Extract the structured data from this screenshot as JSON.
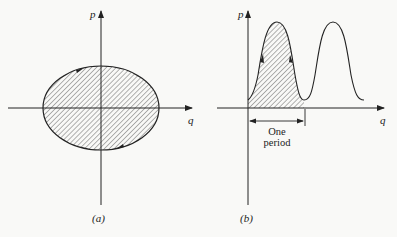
{
  "figure": {
    "panel_a": {
      "caption": "(a)",
      "x_axis_label": "q",
      "y_axis_label": "p",
      "shape": "closed elliptical orbit, hatched interior, clockwise arrows"
    },
    "panel_b": {
      "caption": "(b)",
      "x_axis_label": "q",
      "y_axis_label": "p",
      "period_label_line1": "One",
      "period_label_line2": "period",
      "shape": "periodic curve, first period hatched"
    }
  }
}
